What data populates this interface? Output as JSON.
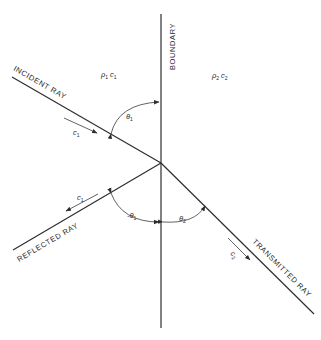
{
  "diagram": {
    "labels": {
      "boundary": "BOUNDARY",
      "incident_ray": "INCIDENT  RAY",
      "reflected_ray": "REFLECTED  RAY",
      "transmitted_ray": "TRANSMITTED  RAY"
    },
    "media": {
      "medium1": {
        "rho": "ρ",
        "rho_sub": "1",
        "c": "c",
        "c_sub": "1"
      },
      "medium2": {
        "rho": "ρ",
        "rho_sub": "2",
        "c": "c",
        "c_sub": "2"
      }
    },
    "velocities": {
      "incident": {
        "c": "c",
        "sub": "1"
      },
      "reflected": {
        "c": "c",
        "sub": "1"
      },
      "transmitted": {
        "c": "c",
        "sub": "2"
      }
    },
    "angles": {
      "incident": {
        "symbol": "θ",
        "sub": "1"
      },
      "reflected": {
        "symbol": "-θ",
        "sub": "1"
      },
      "transmitted": {
        "symbol": "θ",
        "sub": "2"
      }
    },
    "colors": {
      "ink": "#2e2e2e",
      "background": "#ffffff"
    }
  }
}
